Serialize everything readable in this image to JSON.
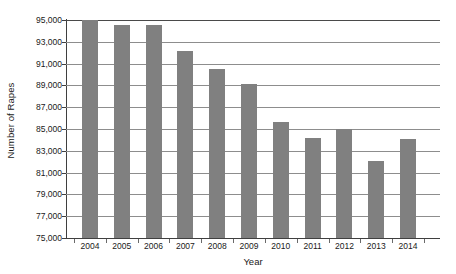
{
  "chart_data": {
    "type": "bar",
    "title": "",
    "subtitle": "",
    "xlabel": "Year",
    "ylabel": "Number of Rapes",
    "categories": [
      "2004",
      "2005",
      "2006",
      "2007",
      "2008",
      "2009",
      "2010",
      "2011",
      "2012",
      "2013",
      "2014"
    ],
    "values": [
      95000,
      94500,
      94500,
      92200,
      90500,
      89100,
      85600,
      84200,
      85000,
      82100,
      84100
    ],
    "series": [
      {
        "name": "Number of Rapes",
        "values": [
          95000,
          94500,
          94500,
          92200,
          90500,
          89100,
          85600,
          84200,
          85000,
          82100,
          84100
        ]
      }
    ],
    "ylim": [
      75000,
      95000
    ],
    "ytick_values": [
      75000,
      77000,
      79000,
      81000,
      83000,
      85000,
      87000,
      89000,
      91000,
      93000,
      95000
    ],
    "ytick_labels": [
      "75,000",
      "77,000",
      "79,000",
      "81,000",
      "83,000",
      "85,000",
      "87,000",
      "89,000",
      "91,000",
      "93,000",
      "95,000"
    ],
    "grid": true,
    "grid_axis": "y",
    "legend": false,
    "legend_position": "none",
    "bar_color": "#808080",
    "background_color": "#ffffff",
    "axis_color": "#3f3f3f",
    "gridline_color": "#8d8d8d",
    "annotations": []
  }
}
